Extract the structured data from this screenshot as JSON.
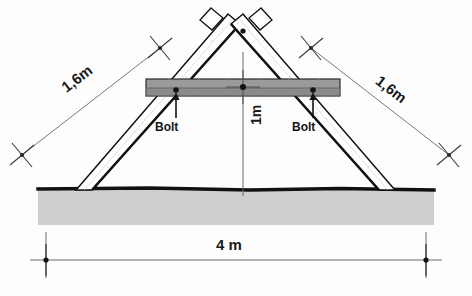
{
  "diagram": {
    "ground": {
      "label": "ground",
      "fill": "#cfcfcf",
      "edge": "#111111"
    },
    "members": {
      "leg_left": {
        "name": "left-leg-plank",
        "length_label": "1,6m"
      },
      "leg_right": {
        "name": "right-leg-plank",
        "length_label": "1,6m"
      },
      "crossbeam": {
        "name": "horizontal-crossbeam",
        "fill": "#9a9a9a"
      }
    },
    "dimensions": [
      {
        "id": "left-leg",
        "text": "1,6m",
        "orientation": "diagonal-left"
      },
      {
        "id": "right-leg",
        "text": "1,6m",
        "orientation": "diagonal-right"
      },
      {
        "id": "height",
        "text": "1m",
        "orientation": "vertical"
      },
      {
        "id": "span",
        "text": "4 m",
        "orientation": "horizontal"
      }
    ],
    "annotations": [
      {
        "id": "bolt-left",
        "text": "Bolt"
      },
      {
        "id": "bolt-right",
        "text": "Bolt"
      }
    ],
    "colors": {
      "plank_face": "#ffffff",
      "plank_edge": "#111111",
      "beam_fill": "#9a9a9a",
      "beam_dark": "#6f6f6f",
      "ground_fill": "#cfcfcf",
      "dim_line": "#5a5a5a"
    }
  }
}
